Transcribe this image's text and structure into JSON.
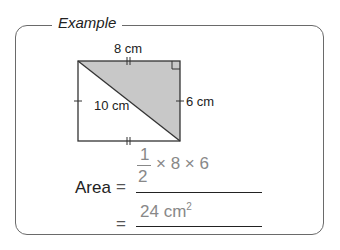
{
  "panel": {
    "title": "Example"
  },
  "figure": {
    "type": "rectangle-with-diagonal",
    "shaded_region": "upper-right triangle",
    "fill_color": "#c8c8c8",
    "labels": {
      "top": "8 cm",
      "right": "6 cm",
      "diagonal": "10 cm"
    },
    "markings": [
      "double-tick top",
      "double-tick bottom",
      "single-tick left",
      "single-tick right",
      "right-angle top-right"
    ]
  },
  "solution": {
    "area_label": "Area",
    "equals": "=",
    "step1": {
      "fraction_num": "1",
      "fraction_den": "2",
      "rest": "× 8 × 6"
    },
    "step2": {
      "value": "24 cm",
      "exponent": "2"
    }
  }
}
